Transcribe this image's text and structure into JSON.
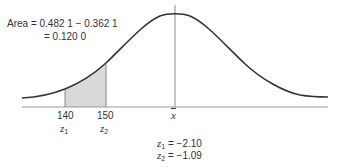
{
  "annotation": {
    "area_line1": "Area = 0.482 1 − 0.362 1",
    "area_line2": "= 0.120 0"
  },
  "axis": {
    "tick_140": "140",
    "tick_150": "150",
    "mean_symbol": "x",
    "z1_sym": "z",
    "z1_sub": "1",
    "z2_sym": "z",
    "z2_sub": "2"
  },
  "results": {
    "z1_sym": "z",
    "z1_sub": "1",
    "z1_val": " = −2.10",
    "z2_sym": "z",
    "z2_sub": "2",
    "z2_val": " = −1.09"
  },
  "colors": {
    "curve": "#333333",
    "shade": "#d9d9d9",
    "baseline": "#999999"
  }
}
